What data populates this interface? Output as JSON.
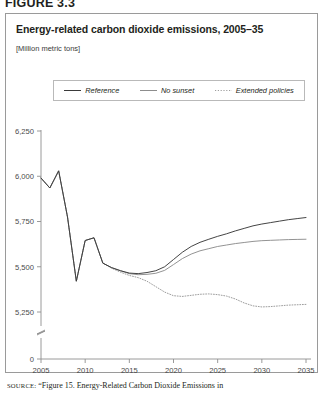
{
  "figure_label": "FIGURE 3.3",
  "panel": {
    "title": "Energy-related carbon dioxide emissions, 2005–35",
    "subtitle": "[Million metric tons]"
  },
  "legend": {
    "position": "top-center",
    "items": [
      {
        "label": "Reference",
        "style": "solid",
        "color": "#3a3a3a",
        "name": "reference"
      },
      {
        "label": "No sunset",
        "style": "solid",
        "color": "#8d8d8d",
        "name": "no-sunset"
      },
      {
        "label": "Extended policies",
        "style": "dotted",
        "color": "#9e9e9e",
        "name": "extended-policies"
      }
    ]
  },
  "source": {
    "prefix": "SOURCE:",
    "text": "“Figure 15. Energy-Related Carbon Dioxide Emissions in"
  },
  "chart_data": {
    "type": "line",
    "title": "Energy-related carbon dioxide emissions, 2005–35",
    "subtitle": "[Million metric tons]",
    "xlabel": "",
    "ylabel": "Million metric tons",
    "xlim": [
      2005,
      2035
    ],
    "ylim": [
      5150,
      6250
    ],
    "y_axis_break": true,
    "y_break_between": [
      0,
      5150
    ],
    "grid": false,
    "xticks": [
      2005,
      2010,
      2015,
      2020,
      2025,
      2030,
      2035
    ],
    "xticklabels": [
      "2005",
      "2010",
      "2015",
      "2020",
      "2025",
      "2030",
      "2035"
    ],
    "yticks": [
      0,
      5250,
      5500,
      5750,
      6000,
      6250
    ],
    "yticklabels": [
      "0",
      "5,250",
      "5,500",
      "5,750",
      "6,000",
      "6,250"
    ],
    "x": [
      2005,
      2006,
      2007,
      2008,
      2009,
      2010,
      2011,
      2012,
      2013,
      2014,
      2015,
      2016,
      2017,
      2018,
      2019,
      2020,
      2021,
      2022,
      2023,
      2024,
      2025,
      2026,
      2027,
      2028,
      2029,
      2030,
      2031,
      2032,
      2033,
      2034,
      2035
    ],
    "series": [
      {
        "name": "Reference",
        "style": "solid",
        "color": "#3a3a3a",
        "values": [
          5990,
          5935,
          6030,
          5775,
          5420,
          5645,
          5660,
          5520,
          5495,
          5478,
          5465,
          5462,
          5468,
          5478,
          5500,
          5540,
          5580,
          5612,
          5635,
          5652,
          5668,
          5682,
          5698,
          5712,
          5726,
          5736,
          5744,
          5752,
          5760,
          5766,
          5772
        ]
      },
      {
        "name": "No sunset",
        "style": "solid",
        "color": "#8d8d8d",
        "values": [
          5990,
          5935,
          6030,
          5775,
          5420,
          5645,
          5660,
          5520,
          5495,
          5478,
          5462,
          5456,
          5458,
          5464,
          5480,
          5512,
          5545,
          5570,
          5588,
          5600,
          5612,
          5620,
          5628,
          5634,
          5640,
          5644,
          5646,
          5648,
          5650,
          5651,
          5652
        ]
      },
      {
        "name": "Extended policies",
        "style": "dotted",
        "color": "#9e9e9e",
        "values": [
          5990,
          5935,
          6030,
          5775,
          5420,
          5645,
          5660,
          5520,
          5492,
          5470,
          5452,
          5440,
          5420,
          5390,
          5360,
          5340,
          5336,
          5342,
          5348,
          5350,
          5346,
          5338,
          5322,
          5300,
          5284,
          5278,
          5280,
          5284,
          5288,
          5290,
          5292
        ]
      }
    ]
  }
}
